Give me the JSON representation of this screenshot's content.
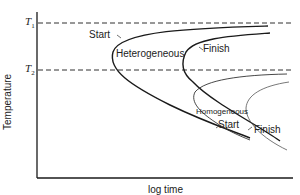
{
  "diagram": {
    "title": "",
    "type": "TTT (time-temperature-transformation) nucleation diagram",
    "axes": {
      "xlabel": "log time",
      "ylabel": "Temperature"
    },
    "reference_lines": [
      {
        "label_main": "T",
        "label_sub": "1",
        "style": "dashed"
      },
      {
        "label_main": "T",
        "label_sub": "2",
        "style": "dashed"
      }
    ],
    "regions": {
      "heterogeneous": "Heterogeneous",
      "homogeneous": "Homogeneous"
    },
    "curve_labels": {
      "het_start": "Start",
      "het_finish": "Finish",
      "hom_start": "Start",
      "hom_finish": "Finish"
    },
    "colors": {
      "line": "#1a1a1a",
      "thin_line": "#555555",
      "background": "#ffffff"
    }
  }
}
